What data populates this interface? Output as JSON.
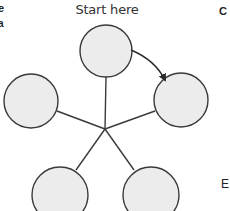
{
  "diagram": {
    "start_label": "Start here",
    "edge_text": {
      "left_top_1": "e",
      "left_top_2": "a",
      "right_top": "C",
      "right_bottom": "E"
    },
    "hub": {
      "x": 105,
      "y": 129
    },
    "nodes": [
      {
        "id": "top",
        "cx": 106,
        "cy": 51,
        "r": 26
      },
      {
        "id": "right",
        "cx": 181,
        "cy": 100,
        "r": 27
      },
      {
        "id": "left",
        "cx": 31,
        "cy": 101,
        "r": 27
      },
      {
        "id": "bottom-left",
        "cx": 60,
        "cy": 193,
        "r": 28
      },
      {
        "id": "bottom-right",
        "cx": 151,
        "cy": 193,
        "r": 28
      }
    ],
    "arrow": {
      "from": "top",
      "to": "right",
      "direction": "clockwise"
    },
    "colors": {
      "node_fill": "#ececec",
      "stroke": "#3a3a3a",
      "background": "#ffffff"
    }
  }
}
